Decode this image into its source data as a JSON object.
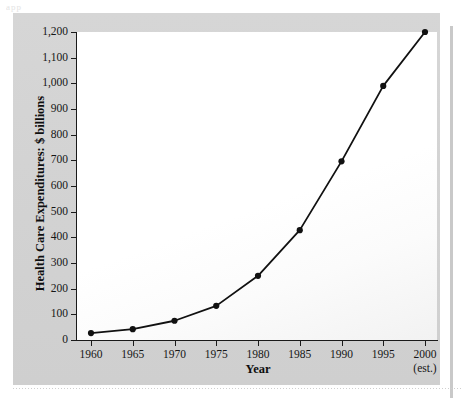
{
  "figure": {
    "artifact_text": "app",
    "background_color": "#d3d3d3",
    "plot_background_color": "#ffffff",
    "line_color": "#111111"
  },
  "chart_data": {
    "type": "line",
    "title": "",
    "xlabel": "Year",
    "ylabel": "Health Care Expenditures: $ billions",
    "x": [
      1960,
      1965,
      1970,
      1975,
      1980,
      1985,
      1990,
      1995,
      2000
    ],
    "categories": [
      "1960",
      "1965",
      "1970",
      "1975",
      "1980",
      "1985",
      "1990",
      "1995",
      "2000"
    ],
    "values": [
      27,
      42,
      75,
      133,
      250,
      428,
      696,
      990,
      1200
    ],
    "series": [
      {
        "name": "Health Care Expenditures",
        "values": [
          27,
          42,
          75,
          133,
          250,
          428,
          696,
          990,
          1200
        ]
      }
    ],
    "xtick_labels": [
      "1960",
      "1965",
      "1970",
      "1975",
      "1980",
      "1985",
      "1990",
      "1995",
      "2000"
    ],
    "xtick_sublabels": [
      "",
      "",
      "",
      "",
      "",
      "",
      "",
      "",
      "(est.)"
    ],
    "ytick_labels": [
      "0",
      "100",
      "200",
      "300",
      "400",
      "500",
      "600",
      "700",
      "800",
      "900",
      "1,000",
      "1,100",
      "1,200"
    ],
    "ytick_values": [
      0,
      100,
      200,
      300,
      400,
      500,
      600,
      700,
      800,
      900,
      1000,
      1100,
      1200
    ],
    "ylim": [
      0,
      1200
    ],
    "xlim": [
      1960,
      2000
    ],
    "grid": false,
    "legend": null,
    "marker": "filled-circle",
    "annotations": [
      "(est.) under the 2000 tick label"
    ]
  }
}
